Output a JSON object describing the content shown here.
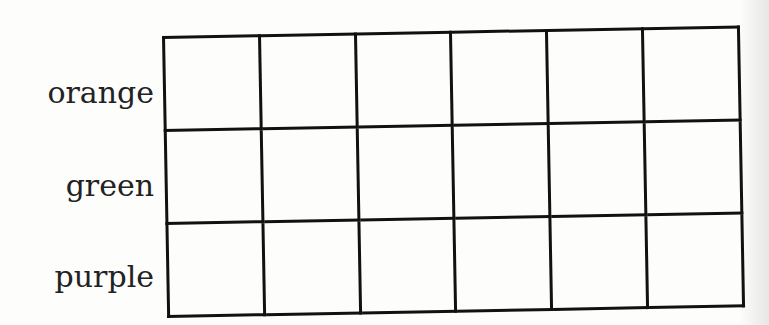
{
  "table": {
    "columns": 6,
    "rows": [
      {
        "label": "orange",
        "cells": [
          "",
          "",
          "",
          "",
          "",
          ""
        ]
      },
      {
        "label": "green",
        "cells": [
          "",
          "",
          "",
          "",
          "",
          ""
        ]
      },
      {
        "label": "purple",
        "cells": [
          "",
          "",
          "",
          "",
          "",
          ""
        ]
      }
    ],
    "line_color": "#111111",
    "background_color": "#fdfdfc"
  }
}
